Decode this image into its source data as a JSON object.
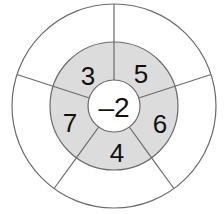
{
  "diagram": {
    "kind": "concentric-sector-wheel",
    "title": "",
    "colors": {
      "outer_ring_fill": "#ffffff",
      "middle_ring_fill": "#dcdcdc",
      "center_fill": "#ffffff",
      "stroke": "#6b6b6b",
      "text": "#111111",
      "background": "#ffffff"
    },
    "geometry": {
      "center_x": 114,
      "center_y": 106,
      "outer_radius": 102,
      "middle_radius": 64,
      "center_radius": 26,
      "sector_boundaries_deg": [
        90,
        162,
        234,
        306,
        18
      ]
    },
    "center": {
      "value": "–2",
      "name": "center-value"
    },
    "middle_ring": {
      "segments": [
        {
          "value": "3",
          "label_x": 88,
          "label_y": 76,
          "name": "segment-3"
        },
        {
          "value": "5",
          "label_x": 141,
          "label_y": 74,
          "name": "segment-5"
        },
        {
          "value": "6",
          "label_x": 160,
          "label_y": 124,
          "name": "segment-6"
        },
        {
          "value": "4",
          "label_x": 117,
          "label_y": 153,
          "name": "segment-4"
        },
        {
          "value": "7",
          "label_x": 70,
          "label_y": 123,
          "name": "segment-7"
        }
      ]
    },
    "outer_ring": {
      "segments": [
        {
          "value": "",
          "name": "outer-segment-top-left"
        },
        {
          "value": "",
          "name": "outer-segment-top-right"
        },
        {
          "value": "",
          "name": "outer-segment-right"
        },
        {
          "value": "",
          "name": "outer-segment-bottom"
        },
        {
          "value": "",
          "name": "outer-segment-left"
        }
      ]
    }
  }
}
